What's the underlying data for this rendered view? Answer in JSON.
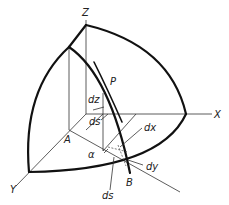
{
  "figure": {
    "labels": {
      "z_axis": "Z",
      "x_axis": "X",
      "y_axis": "Y",
      "point_p": "P",
      "point_a": "A",
      "point_b": "B",
      "dz": "dz",
      "ds_upper": "ds",
      "dx": "dx",
      "dy": "dy",
      "ds_lower": "ds",
      "alpha": "α"
    },
    "colors": {
      "stroke": "#111111",
      "background": "#ffffff"
    }
  }
}
